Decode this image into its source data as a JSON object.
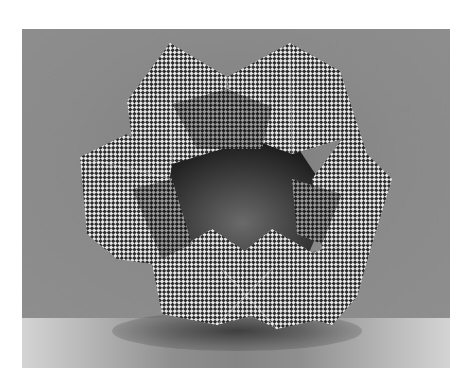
{
  "image": {
    "subject": "Checkered paper modular origami ring sculpture",
    "description": "Grayscale photograph of a ring-shaped sculpture made of folded checkerboard-patterned paper units, standing on a light surface in front of a gray backdrop",
    "colors": {
      "backdrop": "#8a8a8a",
      "floor_edge": "#d4d4d4",
      "floor_center": "#858585",
      "checker_dark": "#2a2a2a",
      "checker_light": "#e8e8e8",
      "page_background": "#ffffff"
    }
  }
}
